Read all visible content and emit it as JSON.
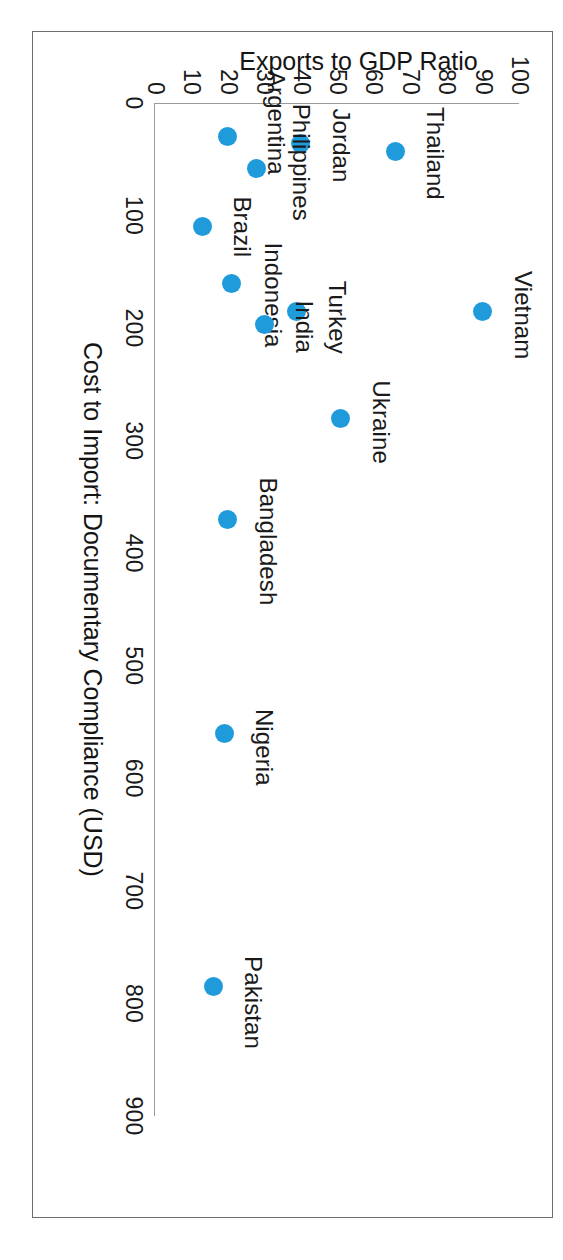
{
  "chart_data": {
    "type": "scatter",
    "title": "",
    "xlabel": "Cost to Import: Documentary Compliance (USD)",
    "ylabel": "Exports to GDP Ratio",
    "xlim": [
      0,
      900
    ],
    "ylim": [
      0,
      100
    ],
    "xticks": [
      0,
      100,
      200,
      300,
      400,
      500,
      600,
      700,
      800,
      900
    ],
    "yticks": [
      0,
      10,
      20,
      30,
      40,
      50,
      60,
      70,
      80,
      90,
      100
    ],
    "xtick_labels": [
      "0",
      "100",
      "200",
      "300",
      "400",
      "500",
      "600",
      "700",
      "800",
      "900"
    ],
    "ytick_labels": [
      "0",
      "10",
      "20",
      "30",
      "40",
      "50",
      "60",
      "70",
      "80",
      "90",
      "100"
    ],
    "grid": false,
    "legend": false,
    "marker_color": "#1f9bdc",
    "axis_color": "#9a9a9a",
    "rotation_deg": 90,
    "points": [
      {
        "label": "Argentina",
        "x": 30,
        "y": 20,
        "label_dx": -14,
        "label_dy": -48
      },
      {
        "label": "Jordan",
        "x": 36,
        "y": 40,
        "label_dx": 2,
        "label_dy": -40
      },
      {
        "label": "Thailand",
        "x": 43,
        "y": 66,
        "label_dx": 2,
        "label_dy": -40
      },
      {
        "label": "Philippines",
        "x": 58,
        "y": 28,
        "label_dx": -6,
        "label_dy": -44
      },
      {
        "label": "Brazil",
        "x": 110,
        "y": 13,
        "label_dx": 0,
        "label_dy": -40
      },
      {
        "label": "Indonesia",
        "x": 160,
        "y": 21,
        "label_dx": 12,
        "label_dy": -42
      },
      {
        "label": "Turkey",
        "x": 185,
        "y": 39,
        "label_dx": 6,
        "label_dy": -40
      },
      {
        "label": "Vietnam",
        "x": 185,
        "y": 90,
        "label_dx": 4,
        "label_dy": -40
      },
      {
        "label": "India",
        "x": 197,
        "y": 30,
        "label_dx": 2,
        "label_dy": -40
      },
      {
        "label": "Ukraine",
        "x": 280,
        "y": 51,
        "label_dx": 4,
        "label_dy": -40
      },
      {
        "label": "Bangladesh",
        "x": 370,
        "y": 20,
        "label_dx": 22,
        "label_dy": -40
      },
      {
        "label": "Nigeria",
        "x": 560,
        "y": 19,
        "label_dx": 14,
        "label_dy": -40
      },
      {
        "label": "Pakistan",
        "x": 785,
        "y": 16,
        "label_dx": 16,
        "label_dy": -40
      }
    ]
  }
}
